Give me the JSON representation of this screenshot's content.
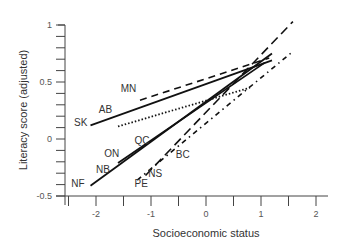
{
  "chart_data": {
    "type": "line",
    "title": "",
    "xlabel": "Socioeconomic status",
    "ylabel": "Literacy score (adjusted)",
    "xlim": [
      -2.55,
      2.2
    ],
    "ylim": [
      -0.5,
      1.0
    ],
    "x_ticks": [
      -2,
      -1,
      0,
      1,
      2
    ],
    "x_tick_labels": [
      "-2",
      "-1",
      "0",
      "1",
      "2"
    ],
    "y_ticks": [
      -0.5,
      0,
      0.5,
      1
    ],
    "y_tick_labels": [
      "-0.5",
      "0",
      "0.5",
      "1"
    ],
    "grid": false,
    "legend": "none (direct labels)",
    "series": [
      {
        "name": "SK/AB",
        "style": "solid",
        "x": [
          -2.1,
          1.2
        ],
        "y": [
          0.12,
          0.69
        ]
      },
      {
        "name": "MN",
        "style": "dashed",
        "x": [
          -1.2,
          1.15
        ],
        "y": [
          0.34,
          0.71
        ]
      },
      {
        "name": "QC",
        "style": "dotted",
        "x": [
          -1.6,
          0.8
        ],
        "y": [
          0.11,
          0.45
        ]
      },
      {
        "name": "NF",
        "style": "solid",
        "x": [
          -2.1,
          1.2
        ],
        "y": [
          -0.41,
          0.75
        ]
      },
      {
        "name": "ON/NB",
        "style": "solid",
        "x": [
          -1.6,
          1.07
        ],
        "y": [
          -0.21,
          0.67
        ]
      },
      {
        "name": "NS/PE",
        "style": "long-dashed",
        "x": [
          -1.1,
          1.58
        ],
        "y": [
          -0.32,
          1.03
        ]
      },
      {
        "name": "BC",
        "style": "dash-dot",
        "x": [
          -1.25,
          1.56
        ],
        "y": [
          -0.36,
          0.76
        ]
      }
    ],
    "labels": [
      {
        "text": "MN",
        "x": -1.55,
        "y": 0.41
      },
      {
        "text": "AB",
        "x": -1.95,
        "y": 0.23
      },
      {
        "text": "SK",
        "x": -2.4,
        "y": 0.11
      },
      {
        "text": "QC",
        "x": -1.3,
        "y": -0.04
      },
      {
        "text": "ON",
        "x": -1.85,
        "y": -0.16
      },
      {
        "text": "BC",
        "x": -0.55,
        "y": -0.17
      },
      {
        "text": "NB",
        "x": -2.0,
        "y": -0.3
      },
      {
        "text": "NS",
        "x": -1.05,
        "y": -0.33
      },
      {
        "text": "PE",
        "x": -1.3,
        "y": -0.42
      },
      {
        "text": "NF",
        "x": -2.45,
        "y": -0.42
      }
    ]
  }
}
